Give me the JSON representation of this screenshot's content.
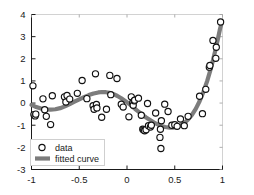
{
  "chart_data": {
    "type": "scatter",
    "title": "",
    "xlabel": "",
    "ylabel": "",
    "xlim": [
      -1,
      1
    ],
    "ylim": [
      -3,
      4
    ],
    "grid": false,
    "legend_position": "lower left",
    "xticks": [
      -1,
      -0.5,
      0,
      0.5,
      1
    ],
    "xtick_labels": [
      "-1",
      "-0.5",
      "0",
      "0.5",
      "1"
    ],
    "yticks": [
      -3,
      -2,
      -1,
      0,
      1,
      2,
      3,
      4
    ],
    "ytick_labels": [
      "-3",
      "-2",
      "-1",
      "0",
      "1",
      "2",
      "3",
      "4"
    ],
    "series": [
      {
        "name": "data",
        "type": "scatter",
        "marker": "open-circle",
        "marker_color": "#111111",
        "points": [
          [
            -0.985,
            0.78
          ],
          [
            -0.975,
            -0.52
          ],
          [
            -0.962,
            -0.58
          ],
          [
            -0.955,
            -0.5
          ],
          [
            -0.88,
            0.19
          ],
          [
            -0.862,
            -0.3
          ],
          [
            -0.845,
            -0.6
          ],
          [
            -0.8,
            -0.97
          ],
          [
            -0.782,
            0.33
          ],
          [
            -0.655,
            0.28
          ],
          [
            -0.64,
            0.05
          ],
          [
            -0.628,
            0.34
          ],
          [
            -0.6,
            0.18
          ],
          [
            -0.52,
            0.44
          ],
          [
            -0.47,
            1.02
          ],
          [
            -0.42,
            0.2
          ],
          [
            -0.355,
            -0.12
          ],
          [
            -0.345,
            -0.28
          ],
          [
            -0.33,
            1.32
          ],
          [
            -0.32,
            -0.06
          ],
          [
            -0.315,
            -0.22
          ],
          [
            -0.265,
            -0.64
          ],
          [
            -0.215,
            -0.28
          ],
          [
            -0.18,
            1.25
          ],
          [
            -0.17,
            0.38
          ],
          [
            -0.105,
            1.11
          ],
          [
            -0.06,
            -0.05
          ],
          [
            -0.04,
            -0.18
          ],
          [
            0.02,
            -0.62
          ],
          [
            0.045,
            0.28
          ],
          [
            0.06,
            0.02
          ],
          [
            0.065,
            -0.1
          ],
          [
            0.075,
            0.1
          ],
          [
            0.08,
            0.13
          ],
          [
            0.12,
            0.22
          ],
          [
            0.15,
            -0.55
          ],
          [
            0.165,
            -1.18
          ],
          [
            0.175,
            -1.22
          ],
          [
            0.185,
            -1.25
          ],
          [
            0.2,
            -1.2
          ],
          [
            0.215,
            -0.02
          ],
          [
            0.225,
            -1.02
          ],
          [
            0.245,
            -1.08
          ],
          [
            0.255,
            -1.0
          ],
          [
            0.3,
            -0.45
          ],
          [
            0.345,
            -1.55
          ],
          [
            0.35,
            -1.18
          ],
          [
            0.355,
            -2.05
          ],
          [
            0.36,
            -0.8
          ],
          [
            0.395,
            -0.05
          ],
          [
            0.43,
            -0.38
          ],
          [
            0.47,
            -1.0
          ],
          [
            0.5,
            -0.98
          ],
          [
            0.525,
            -1.05
          ],
          [
            0.56,
            -0.72
          ],
          [
            0.6,
            -1.02
          ],
          [
            0.64,
            -0.6
          ],
          [
            0.76,
            0.31
          ],
          [
            0.79,
            -0.48
          ],
          [
            0.825,
            0.62
          ],
          [
            0.862,
            1.62
          ],
          [
            0.868,
            1.7
          ],
          [
            0.9,
            2.83
          ],
          [
            0.93,
            2.02
          ],
          [
            0.935,
            2.52
          ],
          [
            0.98,
            3.66
          ]
        ]
      },
      {
        "name": "fitted curve",
        "type": "line",
        "color": "#7c7c7c",
        "line_width": 4.2,
        "points": [
          [
            -1.0,
            -0.08
          ],
          [
            -0.95,
            -0.18
          ],
          [
            -0.9,
            -0.25
          ],
          [
            -0.85,
            -0.29
          ],
          [
            -0.8,
            -0.3
          ],
          [
            -0.75,
            -0.28
          ],
          [
            -0.7,
            -0.23
          ],
          [
            -0.65,
            -0.15
          ],
          [
            -0.6,
            -0.05
          ],
          [
            -0.55,
            0.06
          ],
          [
            -0.5,
            0.17
          ],
          [
            -0.45,
            0.27
          ],
          [
            -0.4,
            0.36
          ],
          [
            -0.35,
            0.43
          ],
          [
            -0.3,
            0.48
          ],
          [
            -0.26,
            0.5
          ],
          [
            -0.22,
            0.49
          ],
          [
            -0.18,
            0.46
          ],
          [
            -0.14,
            0.4
          ],
          [
            -0.1,
            0.32
          ],
          [
            -0.06,
            0.22
          ],
          [
            -0.02,
            0.1
          ],
          [
            0.02,
            -0.03
          ],
          [
            0.06,
            -0.17
          ],
          [
            0.1,
            -0.32
          ],
          [
            0.15,
            -0.49
          ],
          [
            0.2,
            -0.65
          ],
          [
            0.25,
            -0.79
          ],
          [
            0.3,
            -0.92
          ],
          [
            0.35,
            -1.02
          ],
          [
            0.4,
            -1.08
          ],
          [
            0.45,
            -1.11
          ],
          [
            0.48,
            -1.11
          ],
          [
            0.52,
            -1.08
          ],
          [
            0.56,
            -1.01
          ],
          [
            0.6,
            -0.9
          ],
          [
            0.64,
            -0.74
          ],
          [
            0.68,
            -0.53
          ],
          [
            0.72,
            -0.26
          ],
          [
            0.76,
            0.08
          ],
          [
            0.8,
            0.5
          ],
          [
            0.84,
            1.0
          ],
          [
            0.87,
            1.44
          ],
          [
            0.9,
            1.93
          ],
          [
            0.93,
            2.47
          ],
          [
            0.955,
            2.96
          ],
          [
            0.975,
            3.37
          ],
          [
            0.99,
            3.6
          ]
        ]
      }
    ],
    "legend": [
      {
        "label": "data",
        "marker": "open-circle"
      },
      {
        "label": "fitted curve",
        "marker": "thick-line"
      }
    ]
  }
}
